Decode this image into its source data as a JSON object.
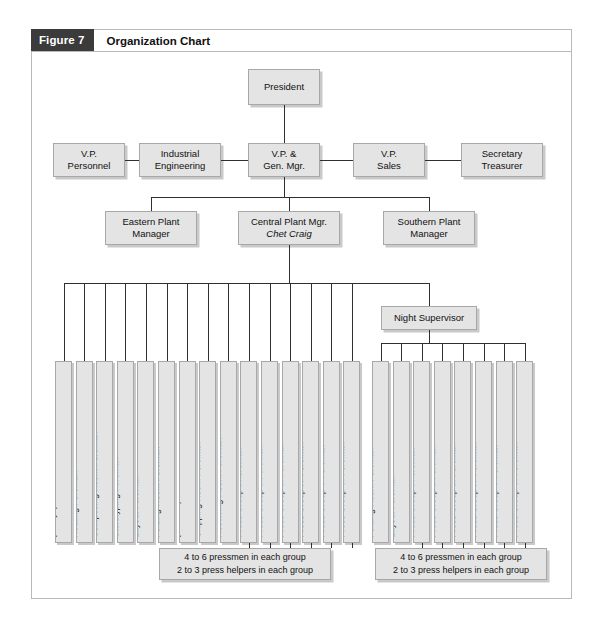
{
  "figure": {
    "badge": "Figure 7",
    "title": "Organization Chart"
  },
  "chart_data": {
    "type": "diagram",
    "title": "Organization Chart",
    "nodes": {
      "president": "President",
      "executive_row": [
        {
          "line1": "V.P.",
          "line2": "Personnel"
        },
        {
          "line1": "Industrial",
          "line2": "Engineering"
        },
        {
          "line1": "V.P. &",
          "line2": "Gen. Mgr."
        },
        {
          "line1": "V.P.",
          "line2": "Sales"
        },
        {
          "line1": "Secretary",
          "line2": "Treasurer"
        }
      ],
      "plant_row": [
        {
          "line1": "Eastern Plant",
          "line2": "Manager",
          "name": ""
        },
        {
          "line1": "Central Plant Mgr.",
          "line2": "",
          "name": "Chet Craig"
        },
        {
          "line1": "Southern Plant",
          "line2": "Manager",
          "name": ""
        }
      ],
      "night_supervisor": "Night Supervisor",
      "day_shift_reports": [
        {
          "label": "Office Manager",
          "name": "(Marilyn)"
        },
        {
          "label": "Routing Foreman",
          "name": ""
        },
        {
          "label": "Composing Room Foreman",
          "name": ""
        },
        {
          "label": "Sterotyping Foreman",
          "name": ""
        },
        {
          "label": "Layout Foreman",
          "name": ""
        },
        {
          "label": "Folding-Room Foreman",
          "name": ""
        },
        {
          "label": "Stockroom Foreman",
          "name": "(Al Noren)"
        },
        {
          "label": "Shipping Room Foreman",
          "name": ""
        },
        {
          "label": "Receiving Room Foreman",
          "name": ""
        },
        {
          "label": "Press Group I Foreman",
          "name": ""
        },
        {
          "label": "Press Group II Foreman",
          "name": ""
        },
        {
          "label": "Press Group III Foreman",
          "name": ""
        },
        {
          "label": "Press Group IV Foreman",
          "name": ""
        },
        {
          "label": "Press Group V Foreman",
          "name": ""
        },
        {
          "label": "Press Group VI Foreman",
          "name": ""
        }
      ],
      "night_shift_reports": [
        {
          "label": "Folding Room Foreman",
          "name": ""
        },
        {
          "label": "Layout Foreman",
          "name": ""
        },
        {
          "label": "Press Group I Foreman",
          "name": ""
        },
        {
          "label": "Press Group II Foreman",
          "name": ""
        },
        {
          "label": "Press Group III Foreman",
          "name": ""
        },
        {
          "label": "Press Group IV Foreman",
          "name": ""
        },
        {
          "label": "Press Group V Foreman",
          "name": ""
        },
        {
          "label": "Press Group VI Foreman",
          "name": ""
        }
      ],
      "captions": [
        {
          "line1": "4 to 6 pressmen in each group",
          "line2": "2 to 3 press helpers in each group"
        },
        {
          "line1": "4 to 6 pressmen in each group",
          "line2": "2 to 3 press helpers in each group"
        }
      ]
    },
    "colors": {
      "box_fill": "#e4e4e4",
      "box_border": "#a8a8a8",
      "box_shadow": "#c9c9c9",
      "line": "#2f2f2f",
      "badge_bg": "#3b3b3b",
      "badge_text": "#ffffff",
      "frame_border": "#b9b9b9",
      "page_bg": "#ffffff"
    }
  }
}
